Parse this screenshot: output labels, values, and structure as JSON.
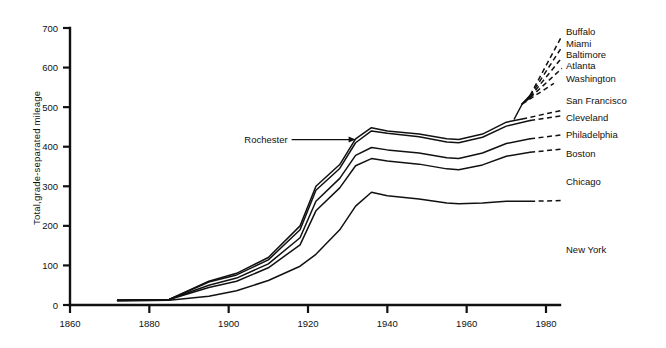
{
  "chart_data": {
    "type": "line",
    "title": "",
    "xlabel": "",
    "ylabel": "Total,grade-separated mileage",
    "xlim": [
      1860,
      1985
    ],
    "ylim": [
      0,
      700
    ],
    "grid": false,
    "legend_position": "right-of-plot-inline",
    "xticks": [
      "1860",
      "1880",
      "1900",
      "1920",
      "1940",
      "1960",
      "1980"
    ],
    "xtick_values": [
      1860,
      1880,
      1900,
      1920,
      1940,
      1960,
      1980
    ],
    "yticks": [
      "0",
      "100",
      "200",
      "300",
      "400",
      "500",
      "600",
      "700"
    ],
    "ytick_values": [
      0,
      100,
      200,
      300,
      400,
      500,
      600,
      700
    ],
    "annotations": [
      {
        "text": "Rochester",
        "points_to_year": 1932,
        "points_to_value": 418
      }
    ],
    "series": [
      {
        "name": "Buffalo",
        "label": "Buffalo",
        "label_y_value": 690,
        "solid": {
          "x": [
            1974,
            1976
          ],
          "y": [
            508,
            530
          ]
        },
        "dashed": {
          "x": [
            1976,
            1984
          ],
          "y": [
            530,
            680
          ]
        }
      },
      {
        "name": "Miami",
        "label": "Miami",
        "label_y_value": 662,
        "solid": {
          "x": [
            1974,
            1976
          ],
          "y": [
            508,
            528
          ]
        },
        "dashed": {
          "x": [
            1976,
            1984
          ],
          "y": [
            528,
            652
          ]
        }
      },
      {
        "name": "Baltimore",
        "label": "Baltimore",
        "label_y_value": 634,
        "solid": {
          "x": [
            1974,
            1976
          ],
          "y": [
            508,
            526
          ]
        },
        "dashed": {
          "x": [
            1976,
            1984
          ],
          "y": [
            526,
            625
          ]
        }
      },
      {
        "name": "Atlanta",
        "label": "Atlanta",
        "label_y_value": 606,
        "solid": {
          "x": [
            1974,
            1976
          ],
          "y": [
            508,
            524
          ]
        },
        "dashed": {
          "x": [
            1976,
            1984
          ],
          "y": [
            524,
            598
          ]
        }
      },
      {
        "name": "Washington",
        "label": "Washington",
        "label_y_value": 573,
        "solid": {
          "x": [
            1972,
            1974
          ],
          "y": [
            470,
            508
          ]
        },
        "dashed": {
          "x": [
            1974,
            1982
          ],
          "y": [
            508,
            560
          ]
        }
      },
      {
        "name": "San Francisco",
        "label": "San Francisco",
        "label_y_value": 518,
        "solid": {
          "x": [
            1872,
            1885,
            1895,
            1902,
            1910,
            1918,
            1922,
            1928,
            1932,
            1936,
            1940,
            1948,
            1955,
            1958,
            1964,
            1970,
            1974
          ],
          "y": [
            12,
            14,
            60,
            80,
            120,
            200,
            300,
            355,
            420,
            448,
            440,
            432,
            420,
            418,
            432,
            462,
            470
          ]
        },
        "dashed": {
          "x": [
            1974,
            1984
          ],
          "y": [
            470,
            492
          ]
        }
      },
      {
        "name": "Cleveland",
        "label": "Cleveland",
        "label_y_value": 475,
        "solid": {
          "x": [
            1872,
            1885,
            1895,
            1902,
            1910,
            1918,
            1922,
            1928,
            1932,
            1936,
            1940,
            1948,
            1955,
            1958,
            1964,
            1970,
            1976
          ],
          "y": [
            12,
            14,
            58,
            76,
            114,
            190,
            290,
            345,
            410,
            440,
            434,
            425,
            412,
            410,
            424,
            452,
            466
          ]
        },
        "dashed": {
          "x": [
            1976,
            1984
          ],
          "y": [
            466,
            478
          ]
        }
      },
      {
        "name": "Philadelphia",
        "label": "Philadelphia",
        "label_y_value": 432,
        "solid": {
          "x": [
            1872,
            1885,
            1895,
            1902,
            1910,
            1918,
            1922,
            1928,
            1932,
            1936,
            1940,
            1948,
            1955,
            1958,
            1964,
            1970,
            1976
          ],
          "y": [
            12,
            14,
            50,
            68,
            104,
            170,
            262,
            320,
            378,
            398,
            392,
            384,
            372,
            370,
            384,
            408,
            420
          ]
        },
        "dashed": {
          "x": [
            1976,
            1984
          ],
          "y": [
            420,
            430
          ]
        }
      },
      {
        "name": "Boston",
        "label": "Boston",
        "label_y_value": 382,
        "solid": {
          "x": [
            1872,
            1885,
            1895,
            1902,
            1910,
            1918,
            1922,
            1928,
            1932,
            1936,
            1940,
            1948,
            1955,
            1958,
            1964,
            1970,
            1976
          ],
          "y": [
            12,
            14,
            44,
            60,
            94,
            152,
            238,
            296,
            352,
            370,
            364,
            356,
            344,
            342,
            354,
            376,
            386
          ]
        },
        "dashed": {
          "x": [
            1976,
            1984
          ],
          "y": [
            386,
            394
          ]
        }
      },
      {
        "name": "Chicago",
        "label": "Chicago",
        "label_y_value": 312,
        "solid": {
          "x": [
            1872,
            1885,
            1895,
            1902,
            1910,
            1918,
            1922,
            1928,
            1932,
            1936,
            1940,
            1948,
            1955,
            1958,
            1964,
            1970,
            1976
          ],
          "y": [
            10,
            12,
            22,
            36,
            62,
            98,
            128,
            190,
            250,
            285,
            276,
            268,
            258,
            256,
            258,
            262,
            262
          ]
        },
        "dashed": {
          "x": [
            1976,
            1984
          ],
          "y": [
            262,
            264
          ]
        }
      },
      {
        "name": "New York",
        "label": "New York",
        "label_y_value": 140,
        "solid": {
          "x": [],
          "y": []
        },
        "dashed": {
          "x": [],
          "y": []
        }
      }
    ]
  }
}
